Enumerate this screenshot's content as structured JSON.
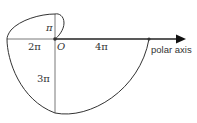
{
  "diagram": {
    "type": "archimedean-spiral",
    "equation": "r = θ",
    "origin_label": "O",
    "axis_label": "polar axis",
    "labels": {
      "pi": "π",
      "two_pi": "2π",
      "three_pi": "3π",
      "four_pi": "4π"
    },
    "colors": {
      "stroke": "#333333",
      "background": "#ffffff"
    }
  }
}
